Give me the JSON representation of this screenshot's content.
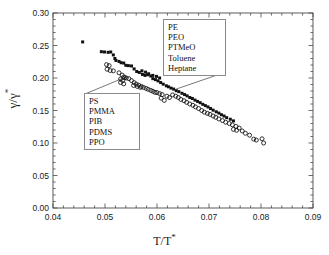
{
  "figure": {
    "ylabel": "γ/γ*",
    "xlabel": "T/T*",
    "ylabel_base": "γ/γ",
    "ylabel_sup": "*",
    "xlabel_base": "T/T",
    "xlabel_sup": "*"
  },
  "annotations": {
    "top_box": {
      "name": "small-molecule-polymer-group",
      "items": [
        "PE",
        "PEO",
        "PTMeO",
        "Toluene",
        "Heptane"
      ]
    },
    "bottom_box": {
      "name": "polymer-group",
      "items": [
        "PS",
        "PMMA",
        "PIB",
        "PDMS",
        "PPO"
      ]
    }
  },
  "chart_data": {
    "type": "scatter",
    "title": "",
    "xlabel": "T/T*",
    "ylabel": "γ/γ*",
    "xlim": [
      0.04,
      0.09
    ],
    "ylim": [
      0.0,
      0.3
    ],
    "xticks": [
      0.04,
      0.05,
      0.06,
      0.07,
      0.08,
      0.09
    ],
    "yticks": [
      0.0,
      0.05,
      0.1,
      0.15,
      0.2,
      0.25,
      0.3
    ],
    "xtick_labels": [
      "0.04",
      "0.05",
      "0.06",
      "0.07",
      "0.08",
      "0.09"
    ],
    "ytick_labels": [
      "0.00",
      "0.05",
      "0.10",
      "0.15",
      "0.20",
      "0.25",
      "0.30"
    ],
    "minor_ticks_per_interval": 5,
    "grid": false,
    "legend": "none",
    "series": [
      {
        "name": "PE, PEO, PTMeO, Toluene, Heptane",
        "marker": "filled-square",
        "color": "#111111",
        "points": [
          [
            0.0457,
            0.2555
          ],
          [
            0.0493,
            0.2405
          ],
          [
            0.0499,
            0.24
          ],
          [
            0.0506,
            0.2395
          ],
          [
            0.0511,
            0.24
          ],
          [
            0.0516,
            0.2355
          ],
          [
            0.0519,
            0.23
          ],
          [
            0.0521,
            0.227
          ],
          [
            0.0527,
            0.2255
          ],
          [
            0.0531,
            0.2235
          ],
          [
            0.0536,
            0.223
          ],
          [
            0.054,
            0.2195
          ],
          [
            0.0545,
            0.219
          ],
          [
            0.0551,
            0.2185
          ],
          [
            0.0556,
            0.214
          ],
          [
            0.0561,
            0.21
          ],
          [
            0.0566,
            0.2085
          ],
          [
            0.0572,
            0.2055
          ],
          [
            0.0577,
            0.204
          ],
          [
            0.0582,
            0.205
          ],
          [
            0.0588,
            0.203
          ],
          [
            0.0592,
            0.199
          ],
          [
            0.0597,
            0.1975
          ],
          [
            0.0602,
            0.1955
          ],
          [
            0.0607,
            0.193
          ],
          [
            0.0612,
            0.1905
          ],
          [
            0.0618,
            0.188
          ],
          [
            0.0622,
            0.1865
          ],
          [
            0.0627,
            0.1845
          ],
          [
            0.0632,
            0.183
          ],
          [
            0.0637,
            0.1805
          ],
          [
            0.0642,
            0.179
          ],
          [
            0.0648,
            0.1765
          ],
          [
            0.0653,
            0.1745
          ],
          [
            0.0658,
            0.1725
          ],
          [
            0.0663,
            0.17
          ],
          [
            0.0668,
            0.1685
          ],
          [
            0.0673,
            0.166
          ],
          [
            0.0678,
            0.164
          ],
          [
            0.0683,
            0.162
          ],
          [
            0.0688,
            0.1595
          ],
          [
            0.0693,
            0.1575
          ],
          [
            0.0698,
            0.1555
          ],
          [
            0.0703,
            0.153
          ],
          [
            0.0708,
            0.1505
          ],
          [
            0.0714,
            0.148
          ],
          [
            0.0719,
            0.146
          ],
          [
            0.0724,
            0.1435
          ],
          [
            0.0729,
            0.1415
          ],
          [
            0.0734,
            0.139
          ],
          [
            0.0741,
            0.1365
          ],
          [
            0.0747,
            0.134
          ],
          [
            0.0592,
            0.204
          ],
          [
            0.0599,
            0.2025
          ],
          [
            0.0605,
            0.2
          ],
          [
            0.0571,
            0.211
          ],
          [
            0.0578,
            0.209
          ],
          [
            0.0584,
            0.2065
          ]
        ]
      },
      {
        "name": "PS, PMMA, PIB, PDMS, PPO",
        "marker": "open-circle",
        "color": "#111111",
        "points": [
          [
            0.0503,
            0.2205
          ],
          [
            0.0508,
            0.219
          ],
          [
            0.0504,
            0.2135
          ],
          [
            0.051,
            0.2115
          ],
          [
            0.0516,
            0.211
          ],
          [
            0.0527,
            0.208
          ],
          [
            0.0533,
            0.2045
          ],
          [
            0.0536,
            0.2015
          ],
          [
            0.0538,
            0.2005
          ],
          [
            0.053,
            0.1985
          ],
          [
            0.0534,
            0.196
          ],
          [
            0.053,
            0.193
          ],
          [
            0.0536,
            0.191
          ],
          [
            0.0541,
            0.2
          ],
          [
            0.0546,
            0.199
          ],
          [
            0.0551,
            0.196
          ],
          [
            0.0556,
            0.193
          ],
          [
            0.056,
            0.1905
          ],
          [
            0.0565,
            0.189
          ],
          [
            0.057,
            0.187
          ],
          [
            0.0574,
            0.1855
          ],
          [
            0.0579,
            0.184
          ],
          [
            0.0583,
            0.1825
          ],
          [
            0.0588,
            0.181
          ],
          [
            0.0592,
            0.1795
          ],
          [
            0.0596,
            0.178
          ],
          [
            0.06,
            0.1775
          ],
          [
            0.0605,
            0.176
          ],
          [
            0.061,
            0.1745
          ],
          [
            0.0608,
            0.169
          ],
          [
            0.0614,
            0.1655
          ],
          [
            0.0619,
            0.172
          ],
          [
            0.0624,
            0.17
          ],
          [
            0.063,
            0.174
          ],
          [
            0.0636,
            0.172
          ],
          [
            0.0641,
            0.17
          ],
          [
            0.0646,
            0.167
          ],
          [
            0.0652,
            0.165
          ],
          [
            0.0657,
            0.1625
          ],
          [
            0.0663,
            0.16
          ],
          [
            0.0669,
            0.158
          ],
          [
            0.0674,
            0.1555
          ],
          [
            0.068,
            0.153
          ],
          [
            0.0686,
            0.15
          ],
          [
            0.0691,
            0.1475
          ],
          [
            0.0697,
            0.1455
          ],
          [
            0.0702,
            0.144
          ],
          [
            0.0708,
            0.1415
          ],
          [
            0.0713,
            0.1395
          ],
          [
            0.0719,
            0.137
          ],
          [
            0.0726,
            0.1345
          ],
          [
            0.0732,
            0.132
          ],
          [
            0.0739,
            0.13
          ],
          [
            0.0745,
            0.128
          ],
          [
            0.0752,
            0.1255
          ],
          [
            0.0758,
            0.123
          ],
          [
            0.0747,
            0.121
          ],
          [
            0.0753,
            0.1195
          ],
          [
            0.0764,
            0.1185
          ],
          [
            0.077,
            0.115
          ],
          [
            0.0778,
            0.112
          ],
          [
            0.0786,
            0.106
          ],
          [
            0.0791,
            0.1045
          ],
          [
            0.0802,
            0.1065
          ],
          [
            0.0805,
            0.1
          ],
          [
            0.0555,
            0.1885
          ],
          [
            0.0562,
            0.187
          ],
          [
            0.0568,
            0.1855
          ]
        ]
      }
    ],
    "leader_lines": [
      {
        "name": "bottom-box-leader",
        "from": [
          0.0555,
          0.136
        ],
        "to": [
          0.0538,
          0.202
        ]
      },
      {
        "name": "bottom-box-leader-2",
        "from": [
          0.04,
          0.136
        ],
        "to": [
          0.04,
          0.136
        ]
      },
      {
        "name": "top-box-leader",
        "from": [
          0.0688,
          0.2285
        ],
        "to": [
          0.0636,
          0.1835
        ]
      }
    ]
  }
}
